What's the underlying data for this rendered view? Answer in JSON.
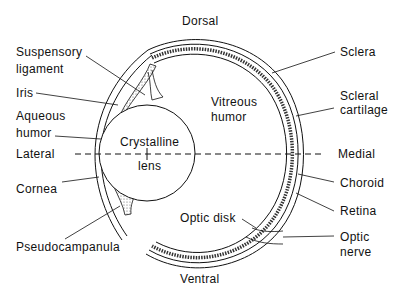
{
  "diagram": {
    "orientation": {
      "top": "Dorsal",
      "bottom": "Ventral",
      "left": "Lateral",
      "right": "Medial"
    },
    "center_labels": {
      "lens_line1": "Crystalline",
      "lens_line2": "lens",
      "vitreous_line1": "Vitreous",
      "vitreous_line2": "humor",
      "optic_disk": "Optic disk"
    },
    "left_labels": {
      "suspensory_line1": "Suspensory",
      "suspensory_line2": "ligament",
      "iris": "Iris",
      "aqueous_line1": "Aqueous",
      "aqueous_line2": "humor",
      "cornea": "Cornea",
      "pseudocampanula": "Pseudocampanula"
    },
    "right_labels": {
      "sclera": "Sclera",
      "scleral_cartilage_line1": "Scleral",
      "scleral_cartilage_line2": "cartilage",
      "choroid": "Choroid",
      "retina": "Retina",
      "optic_nerve_line1": "Optic",
      "optic_nerve_line2": "nerve"
    },
    "colors": {
      "line": "#111111",
      "background": "#ffffff",
      "stipple": "#888888"
    }
  }
}
